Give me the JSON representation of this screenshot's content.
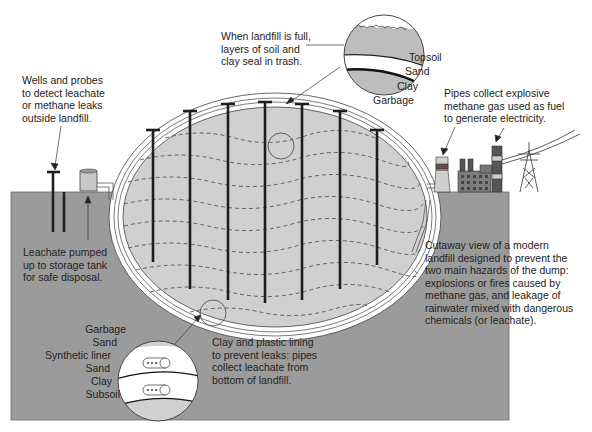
{
  "title": "Cutaway view of a modern landfill",
  "colors": {
    "background": "#ffffff",
    "ground": "#9b9b9b",
    "landfill_fill": "#d0d0d0",
    "liner": "#ffffff",
    "pipe": "#1e1e1e",
    "text": "#232323",
    "plant_dark": "#555555",
    "plant_red": "#6e4a4a"
  },
  "callouts": {
    "top_seal": {
      "lines": [
        "When landfill is full,",
        "layers of soil and",
        "clay seal in trash."
      ]
    },
    "wells": {
      "lines": [
        "Wells and probes",
        "to detect leachate",
        "or methane leaks",
        "outside landfill."
      ]
    },
    "methane": {
      "lines": [
        "Pipes collect explosive",
        "methane gas used as fuel",
        "to generate electricity."
      ]
    },
    "leachate_tank": {
      "lines": [
        "Leachate pumped",
        "up to storage tank",
        "for safe disposal."
      ]
    },
    "liner": {
      "lines": [
        "Clay and plastic lining",
        "to prevent leaks: pipes",
        "collect leachate from",
        "bottom of landfill."
      ]
    },
    "caption": {
      "lines": [
        "Cutaway view of a modern",
        "landfill designed to prevent the",
        "two main hazards of the dump:",
        "explosions or fires caused by",
        "methane gas, and leakage of",
        "rainwater mixed with dangerous",
        "chemicals (or leachate)."
      ]
    }
  },
  "top_detail_layers": [
    "Topsoil",
    "Sand",
    "Clay",
    "Garbage"
  ],
  "bottom_detail_layers": [
    "Garbage",
    "Sand",
    "Synthetic liner",
    "Sand",
    "Clay",
    "Subsoil"
  ]
}
